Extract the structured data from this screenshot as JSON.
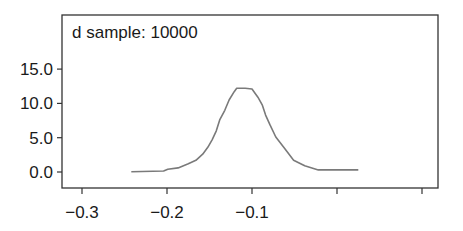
{
  "chart_data": {
    "type": "line",
    "title": "d sample: 10000",
    "xlabel": "",
    "ylabel": "",
    "xlim": [
      -0.322,
      0.119
    ],
    "ylim": [
      -2.4,
      16.9
    ],
    "grid": false,
    "legend": null,
    "x_ticks": [
      -0.3,
      -0.2,
      -0.1,
      0.0,
      0.1
    ],
    "x_tick_labels": [
      "−0.3",
      "−0.2",
      "−0.1",
      "",
      ""
    ],
    "y_ticks": [
      0,
      5,
      10,
      15
    ],
    "y_tick_labels": [
      "0.0",
      "5.0",
      "10.0",
      "15.0"
    ],
    "series": [
      {
        "name": "d density",
        "color": "#7a7a7a",
        "x": [
          -0.242,
          -0.204,
          -0.199,
          -0.187,
          -0.175,
          -0.166,
          -0.158,
          -0.152,
          -0.147,
          -0.142,
          -0.138,
          -0.132,
          -0.127,
          -0.121,
          -0.118,
          -0.108,
          -0.1,
          -0.093,
          -0.088,
          -0.084,
          -0.079,
          -0.072,
          -0.062,
          -0.051,
          -0.038,
          -0.022,
          0.025
        ],
        "y": [
          0.05,
          0.15,
          0.4,
          0.6,
          1.2,
          1.7,
          2.6,
          3.6,
          4.7,
          6.0,
          7.6,
          9.0,
          10.5,
          11.7,
          12.2,
          12.2,
          12.1,
          10.9,
          9.8,
          8.3,
          6.9,
          5.1,
          3.5,
          1.7,
          0.9,
          0.3,
          0.3
        ]
      }
    ]
  },
  "colors": {
    "frame": "#333333",
    "curve": "#7a7a7a",
    "text": "#1a1a1a",
    "background": "#ffffff"
  }
}
